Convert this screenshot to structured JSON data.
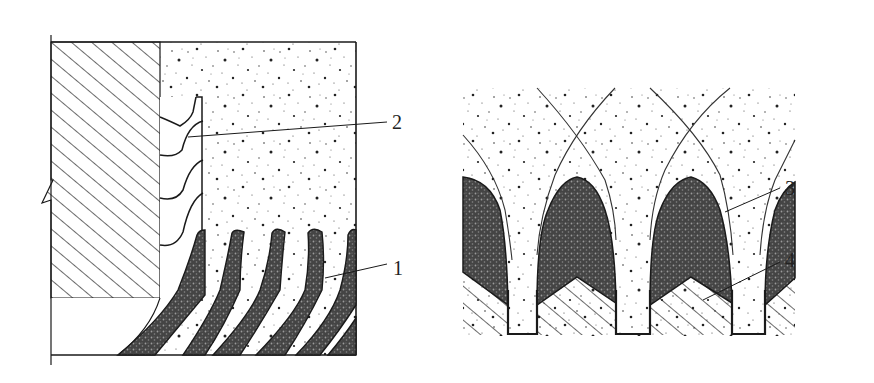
{
  "figure": {
    "left_panel": {
      "labels": [
        {
          "id": "label-2",
          "text": "2",
          "x": 392,
          "y": 129
        },
        {
          "id": "label-1",
          "text": "1",
          "x": 393,
          "y": 275
        }
      ]
    },
    "right_panel": {
      "labels": [
        {
          "id": "label-3",
          "text": "3",
          "x": 785,
          "y": 195
        },
        {
          "id": "label-4",
          "text": "4",
          "x": 785,
          "y": 267
        }
      ]
    },
    "colors": {
      "line": "#1a1a1a",
      "dark_fill": "#3a3a3a",
      "background": "#ffffff"
    }
  }
}
